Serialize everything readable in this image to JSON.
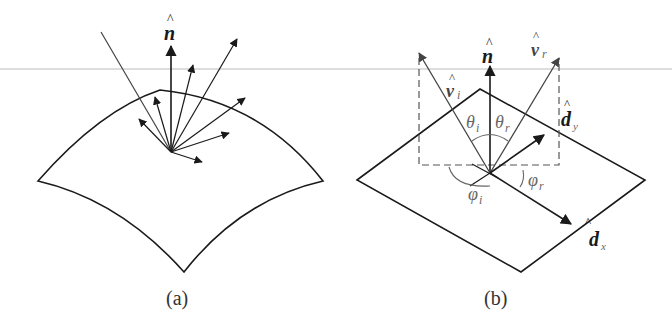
{
  "figure": {
    "panels": [
      {
        "id": "a",
        "caption": "(a)",
        "labels": {
          "normal": "n",
          "normal_hat": "^"
        },
        "description": "Curved surface patch with incident ray and scattered reflection arrows around surface normal"
      },
      {
        "id": "b",
        "caption": "(b)",
        "labels": {
          "normal": "n",
          "incident": "v",
          "incident_sub": "i",
          "reflected": "v",
          "reflected_sub": "r",
          "theta_i": "θ",
          "theta_i_sub": "i",
          "theta_r": "θ",
          "theta_r_sub": "r",
          "phi_i": "φ",
          "phi_i_sub": "i",
          "phi_r": "φ",
          "phi_r_sub": "r",
          "dx": "d",
          "dx_sub": "x",
          "dy": "d",
          "dy_sub": "y",
          "hat": "^"
        },
        "description": "Planar surface with local frame (n, dx, dy), incident direction v_i and reflected direction v_r with polar angles θ and azimuth angles φ"
      }
    ],
    "colors": {
      "stroke": "#1a1a1a",
      "ray": "#444444",
      "dashed": "#555555",
      "angle_text": "#666666",
      "guide_line": "#bbbbbb"
    }
  }
}
